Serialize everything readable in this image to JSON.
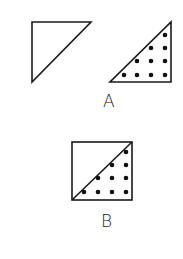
{
  "figures": [
    {
      "label": "A",
      "shapes": [
        {
          "name": "empty-triangle",
          "points": [
            [
              32,
              22
            ],
            [
              91,
              22
            ],
            [
              32,
              82
            ]
          ],
          "filled_dots": false
        },
        {
          "name": "dotted-triangle",
          "points": [
            [
              171,
              22
            ],
            [
              171,
              82
            ],
            [
              110,
              82
            ]
          ],
          "filled_dots": true,
          "dots": [
            [
              165,
              35
            ],
            [
              151,
              48
            ],
            [
              165,
              48
            ],
            [
              137,
              61
            ],
            [
              151,
              61
            ],
            [
              165,
              61
            ],
            [
              124,
              75
            ],
            [
              137,
              75
            ],
            [
              151,
              75
            ],
            [
              165,
              75
            ]
          ]
        }
      ],
      "label_pos": [
        103,
        92
      ]
    },
    {
      "label": "B",
      "shapes": [
        {
          "name": "split-square",
          "rect": [
            72,
            142,
            60,
            58
          ],
          "diagonal": [
            [
              72,
              200
            ],
            [
              132,
              142
            ]
          ],
          "dots": [
            [
              126,
              152
            ],
            [
              112,
              165
            ],
            [
              126,
              165
            ],
            [
              98,
              178
            ],
            [
              112,
              178
            ],
            [
              126,
              178
            ],
            [
              84,
              192
            ],
            [
              98,
              192
            ],
            [
              112,
              192
            ],
            [
              126,
              192
            ]
          ]
        }
      ],
      "label_pos": [
        101,
        212
      ]
    }
  ],
  "colors": {
    "stroke": "#1a1a1a",
    "dot": "#111111",
    "background": "#ffffff"
  }
}
